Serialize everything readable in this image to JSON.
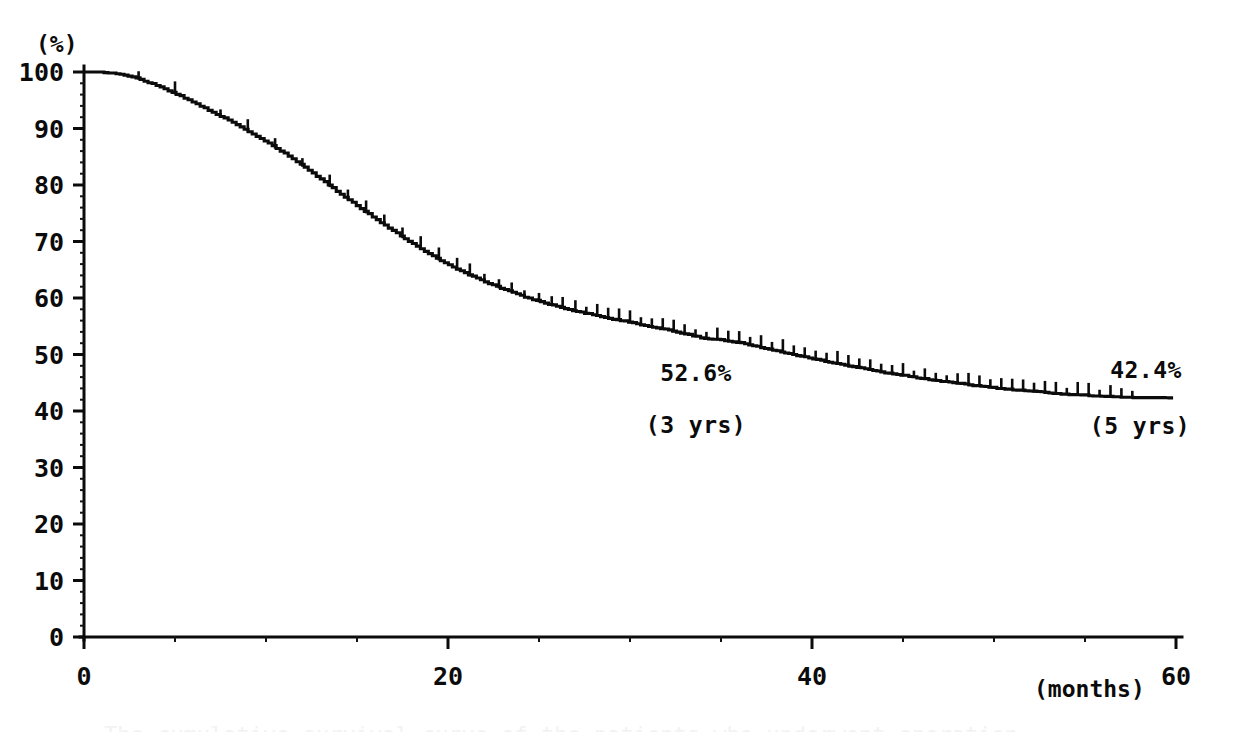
{
  "figure": {
    "kind": "kaplan-meier-survival-plot",
    "y_unit_label": "(%)",
    "x_unit_label": "(months)",
    "caption_partial": "The cumulative survival curve of the patients who underwent operation"
  },
  "annotations": [
    {
      "name": "three-year-survival",
      "value_label": "52.6%",
      "time_label": "(3 yrs)",
      "x_month": 34.2,
      "y_percent": 52.6
    },
    {
      "name": "five-year-survival",
      "value_label": "42.4%",
      "time_label": "(5 yrs)",
      "x_month": 58.0,
      "y_percent": 42.4
    }
  ],
  "chart_data": {
    "type": "line",
    "title": "",
    "subtitle": "",
    "xlabel": "(months)",
    "ylabel": "(%)",
    "xlim": [
      0,
      60
    ],
    "ylim": [
      0,
      100
    ],
    "grid": false,
    "legend": "none",
    "x_ticks": [
      0,
      20,
      40,
      60
    ],
    "x_tick_labels": [
      "0",
      "20",
      "40",
      "60"
    ],
    "x_minor_tick_step": 5,
    "y_ticks": [
      0,
      10,
      20,
      30,
      40,
      50,
      60,
      70,
      80,
      90,
      100
    ],
    "y_tick_labels": [
      "0",
      "10",
      "20",
      "30",
      "40",
      "50",
      "60",
      "70",
      "80",
      "90",
      "100"
    ],
    "y_minor_tick_step": 2,
    "series": [
      {
        "name": "cumulative survival",
        "x": [
          0,
          1,
          2,
          3,
          4,
          5,
          6,
          7,
          8,
          9,
          10,
          11,
          12,
          13,
          14,
          15,
          16,
          17,
          18,
          19,
          20,
          21,
          22,
          23,
          24,
          25,
          26,
          27,
          28,
          29,
          30,
          31,
          32,
          33,
          34,
          35,
          36,
          37,
          38,
          39,
          40,
          41,
          42,
          43,
          44,
          45,
          46,
          47,
          48,
          49,
          50,
          51,
          52,
          53,
          54,
          55,
          56,
          57,
          58,
          59,
          60
        ],
        "values": [
          100,
          100,
          99.6,
          98.8,
          97.6,
          96.2,
          94.6,
          93.0,
          91.3,
          89.5,
          87.6,
          85.6,
          83.4,
          81.0,
          78.6,
          76.3,
          74.0,
          71.8,
          69.7,
          67.7,
          65.9,
          64.3,
          62.9,
          61.6,
          60.4,
          59.4,
          58.5,
          57.7,
          57.0,
          56.3,
          55.7,
          55.0,
          54.4,
          53.7,
          52.9,
          52.6,
          52.1,
          51.4,
          50.7,
          50.0,
          49.3,
          48.6,
          48.0,
          47.4,
          46.8,
          46.3,
          45.8,
          45.3,
          44.9,
          44.5,
          44.1,
          43.8,
          43.5,
          43.2,
          43.0,
          42.8,
          42.6,
          42.5,
          42.4,
          42.4,
          42.4
        ]
      }
    ],
    "censoring_marks_x": [
      3,
      5,
      7.5,
      9,
      10.5,
      12,
      13.5,
      14.5,
      15.5,
      16.5,
      17.5,
      18.5,
      19.5,
      20.5,
      21.2,
      22,
      22.8,
      23.5,
      24.2,
      25,
      25.7,
      26.3,
      27,
      27.6,
      28.2,
      28.8,
      29.4,
      30,
      30.6,
      31.2,
      31.8,
      32.4,
      33,
      33.6,
      34.2,
      34.8,
      35.4,
      36,
      36.6,
      37.2,
      37.8,
      38.4,
      39,
      39.6,
      40.2,
      40.8,
      41.4,
      42,
      42.6,
      43.2,
      43.8,
      44.4,
      45,
      45.6,
      46.2,
      46.8,
      47.4,
      48,
      48.6,
      49.2,
      49.8,
      50.4,
      51,
      51.6,
      52.2,
      52.8,
      53.4,
      54,
      54.6,
      55.2,
      55.8,
      56.4,
      57,
      57.6
    ]
  },
  "colors": {
    "ink": "#0b0b0b",
    "background": "#ffffff"
  }
}
